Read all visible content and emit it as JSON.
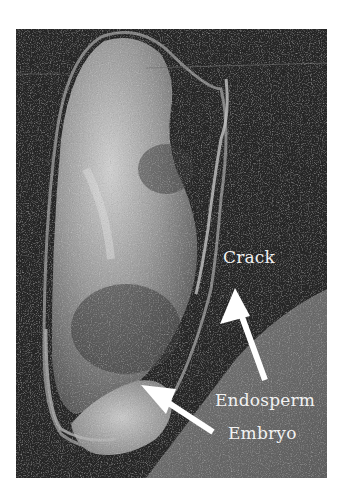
{
  "figure": {
    "labels": {
      "crack": "Crack",
      "endosperm": "Endosperm",
      "embryo": "Embryo"
    },
    "colors": {
      "background": "#2a2a2a",
      "label_text": "#f2f2f2",
      "arrow": "#ffffff"
    }
  }
}
